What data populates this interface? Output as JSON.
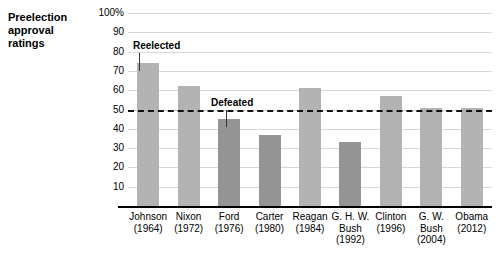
{
  "title": {
    "line1": "Preelection",
    "line2": "approval",
    "line3": "ratings"
  },
  "annotations": {
    "reelected": "Reelected",
    "defeated": "Defeated"
  },
  "colors": {
    "reelected_bar": "#b3b3b3",
    "defeated_bar": "#949494",
    "gridline": "#d8d8d8",
    "reference_line": "#111111",
    "axis": "#000000",
    "background": "#ffffff"
  },
  "chart_data": {
    "type": "bar",
    "title": "Preelection approval ratings",
    "xlabel": "",
    "ylabel": "",
    "ylim": [
      0,
      100
    ],
    "grid": true,
    "legend_position": "inline-annotation",
    "yticks": [
      "100%",
      "90",
      "80",
      "70",
      "60",
      "50",
      "40",
      "30",
      "20",
      "10"
    ],
    "ytick_values": [
      100,
      90,
      80,
      70,
      60,
      50,
      40,
      30,
      20,
      10
    ],
    "reference_line": {
      "value": 50,
      "style": "dashed",
      "label": ""
    },
    "categories": [
      "Johnson (1964)",
      "Nixon (1972)",
      "Ford (1976)",
      "Carter (1980)",
      "Reagan (1984)",
      "G. H. W. Bush (1992)",
      "Clinton (1996)",
      "G. W. Bush (2004)",
      "Obama (2012)"
    ],
    "values": [
      74,
      62,
      45,
      37,
      61,
      33,
      57,
      51,
      51
    ],
    "groups": [
      "Reelected",
      "Reelected",
      "Defeated",
      "Defeated",
      "Reelected",
      "Defeated",
      "Reelected",
      "Reelected",
      "Reelected"
    ],
    "bars": [
      {
        "name": "Johnson",
        "year": "(1964)",
        "value": 74,
        "group": "Reelected"
      },
      {
        "name": "Nixon",
        "year": "(1972)",
        "value": 62,
        "group": "Reelected"
      },
      {
        "name": "Ford",
        "year": "(1976)",
        "value": 45,
        "group": "Defeated"
      },
      {
        "name": "Carter",
        "year": "(1980)",
        "value": 37,
        "group": "Defeated"
      },
      {
        "name": "Reagan",
        "year": "(1984)",
        "value": 61,
        "group": "Reelected"
      },
      {
        "name": "G. H. W. Bush",
        "year": "(1992)",
        "value": 33,
        "group": "Defeated"
      },
      {
        "name": "Clinton",
        "year": "(1996)",
        "value": 57,
        "group": "Reelected"
      },
      {
        "name": "G. W. Bush",
        "year": "(2004)",
        "value": 51,
        "group": "Reelected"
      },
      {
        "name": "Obama",
        "year": "(2012)",
        "value": 51,
        "group": "Reelected"
      }
    ],
    "xtick_labels": [
      {
        "line1": "Johnson",
        "line2": "(1964)",
        "line3": ""
      },
      {
        "line1": "Nixon",
        "line2": "(1972)",
        "line3": ""
      },
      {
        "line1": "Ford",
        "line2": "(1976)",
        "line3": ""
      },
      {
        "line1": "Carter",
        "line2": "(1980)",
        "line3": ""
      },
      {
        "line1": "Reagan",
        "line2": "(1984)",
        "line3": ""
      },
      {
        "line1": "G. H. W.",
        "line2": "Bush",
        "line3": "(1992)"
      },
      {
        "line1": "Clinton",
        "line2": "(1996)",
        "line3": ""
      },
      {
        "line1": "G. W.",
        "line2": "Bush",
        "line3": "(2004)"
      },
      {
        "line1": "Obama",
        "line2": "(2012)",
        "line3": ""
      }
    ]
  }
}
